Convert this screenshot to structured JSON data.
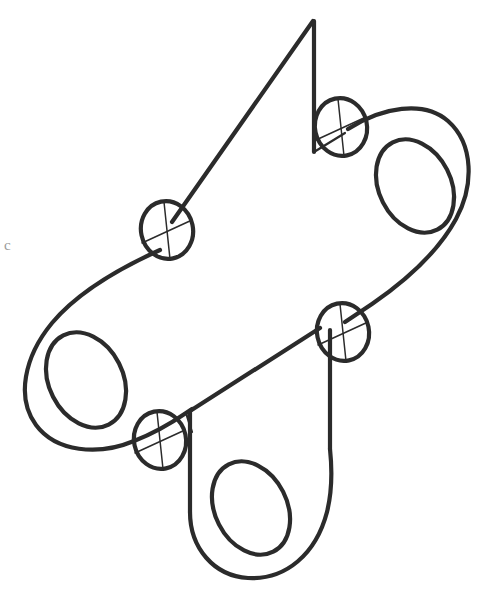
{
  "document": {
    "kind": "technical-line-drawing",
    "title": "Isometric pictorial of a lobed link plate",
    "background_color": "#ffffff",
    "line_color": "#2b2b2b",
    "thin_line_color": "#2b2b2b",
    "canvas_width": 488,
    "canvas_height": 594
  },
  "margin_marks": [
    {
      "glyph": "c",
      "x": 4,
      "y": 238
    }
  ],
  "geometry": {
    "outline_note": "Closed pictorial silhouette: three rounded lobes (left, right, bottom) joined by a central web, plus a sharp upper spike and two V-notches.",
    "apex": {
      "x": 313,
      "y": 20
    },
    "extreme_left": {
      "x": 21,
      "y": 360
    },
    "extreme_right": {
      "x": 470,
      "y": 190
    },
    "extreme_bottom": {
      "x": 250,
      "y": 578
    },
    "outline_path": "M 313 20 L 168 228 L 150 248 C 96 264 46 300 25 348 C 8 390 22 436 62 452 C 92 464 128 456 156 437 L 212 400 L 197 422 C 182 448 178 486 184 516 C 191 550 213 575 247 578 C 282 580 308 556 319 522 C 325 502 325 478 322 457 L 322 330 L 370 283 C 404 258 437 247 455 214 C 477 174 470 131 435 113 C 406 98 372 106 347 124 L 313 148 Z",
    "outline_segments": [
      {
        "name": "spike-left-edge",
        "from": [
          313,
          20
        ],
        "to": [
          168,
          228
        ]
      },
      {
        "name": "upper-left-notch-vertical",
        "from": [
          313,
          20
        ],
        "to": [
          313,
          148
        ]
      },
      {
        "name": "lower-notch-vertical",
        "from": [
          322,
          330
        ],
        "to": [
          322,
          457
        ]
      },
      {
        "name": "mid-notch-diagonal",
        "from": [
          322,
          330
        ],
        "to": [
          212,
          400
        ]
      }
    ],
    "lobe_holes": [
      {
        "name": "left-lobe-hole",
        "cx": 85,
        "cy": 380,
        "rx": 37,
        "ry": 50,
        "rotation": -27
      },
      {
        "name": "right-lobe-hole",
        "cx": 414,
        "cy": 185,
        "rx": 36,
        "ry": 49,
        "rotation": -27
      },
      {
        "name": "bottom-lobe-hole",
        "cx": 250,
        "cy": 508,
        "rx": 36,
        "ry": 49,
        "rotation": -27
      }
    ],
    "fillet_circles": [
      {
        "name": "fillet-upper-left",
        "cx": 167,
        "cy": 230,
        "rx": 26,
        "ry": 29,
        "rotation": -12
      },
      {
        "name": "fillet-upper-right",
        "cx": 341,
        "cy": 127,
        "rx": 26,
        "ry": 29,
        "rotation": -12
      },
      {
        "name": "fillet-lower-right",
        "cx": 343,
        "cy": 332,
        "rx": 26,
        "ry": 29,
        "rotation": -12
      },
      {
        "name": "fillet-lower-left",
        "cx": 160,
        "cy": 440,
        "rx": 26,
        "ry": 29,
        "rotation": -12
      }
    ],
    "fillet_crosshatch": {
      "description": "Each small circle carries a vertical centerline plus a shallow diagonal chord, forming a quartered cross mark.",
      "vertical_line": true,
      "diagonal_line": true,
      "diagonal_slope_deg": -20
    }
  },
  "annotations": {
    "visible_text": [],
    "dimensions": [],
    "labels": []
  }
}
